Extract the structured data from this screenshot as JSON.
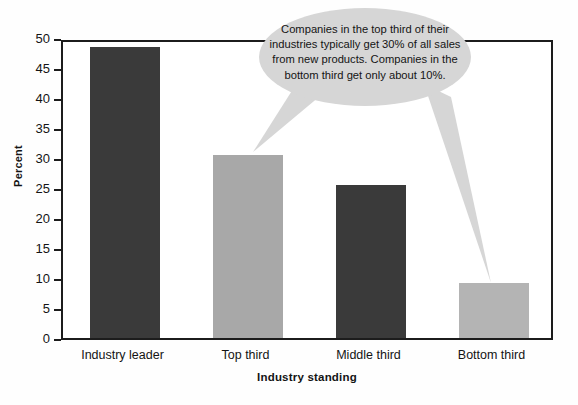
{
  "chart_data": {
    "type": "bar",
    "title": "",
    "subtitle": "",
    "xlabel": "Industry standing",
    "ylabel": "Percent",
    "categories": [
      "Industry leader",
      "Top third",
      "Middle third",
      "Bottom third"
    ],
    "values": [
      48.5,
      30.5,
      25.5,
      9.2
    ],
    "bar_colors": [
      "#3a3a3a",
      "#a8a8a8",
      "#3a3a3a",
      "#b4b4b4"
    ],
    "ylim": [
      0,
      50
    ],
    "ytick_values": [
      0,
      5,
      10,
      15,
      20,
      25,
      30,
      35,
      40,
      45,
      50
    ],
    "ytick_labels": [
      "0",
      "5",
      "10",
      "15",
      "20",
      "25",
      "30",
      "35",
      "40",
      "45",
      "50"
    ],
    "grid": false,
    "legend": false,
    "legend_position": "none",
    "annotations": [
      {
        "name": "callout",
        "text": "Companies in the top third of their industries typically get 30% of all sales from new products. Companies in the bottom third get only about 10%.",
        "points_to": [
          "Top third",
          "Bottom third"
        ],
        "fill_color": "#d6d6d6"
      }
    ]
  },
  "colors": {
    "axis": "#1c1c1c",
    "background": "#fefefe",
    "plot_background": "#ffffff",
    "text": "#141414",
    "bar_dark": "#3a3a3a",
    "bar_light": "#a8a8a8",
    "callout_fill": "#d6d6d6"
  }
}
